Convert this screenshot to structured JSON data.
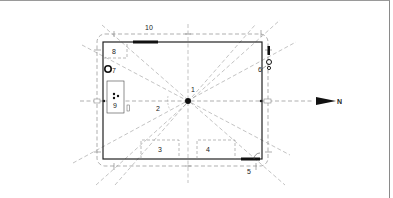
{
  "diagram": {
    "type": "floor-plan-orientation",
    "north_label": "N",
    "markers": [
      {
        "id": "1",
        "label": "1",
        "desc": "center point"
      },
      {
        "id": "2",
        "label": "2",
        "desc": "angle marker"
      },
      {
        "id": "3",
        "label": "3",
        "desc": "dashed box bottom-left"
      },
      {
        "id": "4",
        "label": "4",
        "desc": "dashed box bottom-right"
      },
      {
        "id": "5",
        "label": "5",
        "desc": "bottom wall opening"
      },
      {
        "id": "6",
        "label": "6",
        "desc": "top-right fixtures"
      },
      {
        "id": "7",
        "label": "7",
        "desc": "circle fixture"
      },
      {
        "id": "8",
        "label": "8",
        "desc": "dashed box top-left"
      },
      {
        "id": "9",
        "label": "9",
        "desc": "box with dots"
      },
      {
        "id": "10",
        "label": "10",
        "desc": "top wall opening"
      }
    ]
  },
  "colors": {
    "line": "#222222",
    "dashed": "#8c8c8c",
    "frame": "#9a9a9a"
  }
}
